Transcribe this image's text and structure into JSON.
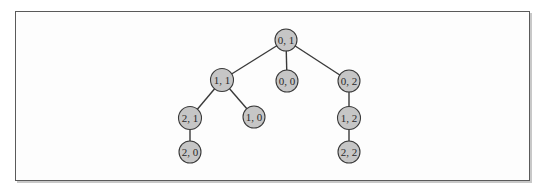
{
  "diagram": {
    "type": "tree",
    "style": {
      "node_fill": "#c6c6c6",
      "node_stroke": "#3a3a3a",
      "edge_color": "#3a3a3a",
      "frame_border": "#5a5a5a",
      "frame_shadow": "#c8c8c8",
      "background": "#fdfdfd"
    },
    "nodes": [
      {
        "id": "n01",
        "label": "0, 1",
        "x": 286,
        "y": 40
      },
      {
        "id": "n11",
        "label": "1, 1",
        "x": 222,
        "y": 80
      },
      {
        "id": "n00",
        "label": "0, 0",
        "x": 287,
        "y": 81
      },
      {
        "id": "n02",
        "label": "0, 2",
        "x": 349,
        "y": 81
      },
      {
        "id": "n21",
        "label": "2, 1",
        "x": 190,
        "y": 118
      },
      {
        "id": "n10",
        "label": "1, 0",
        "x": 254,
        "y": 117
      },
      {
        "id": "n12",
        "label": "1, 2",
        "x": 349,
        "y": 118
      },
      {
        "id": "n20",
        "label": "2, 0",
        "x": 190,
        "y": 152
      },
      {
        "id": "n22",
        "label": "2, 2",
        "x": 349,
        "y": 152
      }
    ],
    "edges": [
      {
        "from": "n01",
        "to": "n11"
      },
      {
        "from": "n01",
        "to": "n00"
      },
      {
        "from": "n01",
        "to": "n02"
      },
      {
        "from": "n11",
        "to": "n21"
      },
      {
        "from": "n11",
        "to": "n10"
      },
      {
        "from": "n21",
        "to": "n20"
      },
      {
        "from": "n02",
        "to": "n12"
      },
      {
        "from": "n12",
        "to": "n22"
      }
    ]
  }
}
